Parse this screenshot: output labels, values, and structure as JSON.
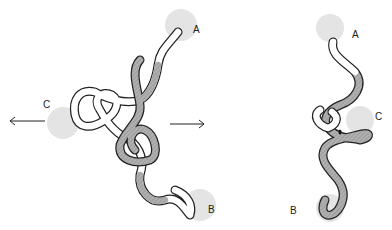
{
  "figure": {
    "left_view": {
      "labels": {
        "a": "A",
        "b": "B",
        "c": "C"
      }
    },
    "right_view": {
      "labels": {
        "a": "A",
        "b": "B",
        "c": "C"
      }
    },
    "colors": {
      "domain_highlight": "#e4e4e4",
      "strand_shaded": "#a8a8a8",
      "strand_light": "#ffffff",
      "outline": "#222222"
    }
  }
}
